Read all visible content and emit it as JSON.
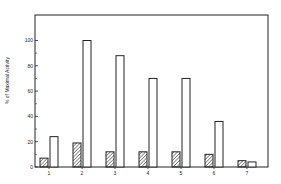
{
  "chart_data": {
    "type": "bar",
    "title": "",
    "xlabel": "",
    "ylabel": "% of Maximal Activity",
    "categories": [
      "1",
      "2",
      "3",
      "4",
      "5",
      "6",
      "7"
    ],
    "series": [
      {
        "name": "hatched",
        "pattern": "diagonal-hatch",
        "values": [
          7,
          19,
          12,
          12,
          12,
          10,
          5
        ]
      },
      {
        "name": "open",
        "pattern": "none",
        "values": [
          24,
          100,
          88,
          70,
          70,
          36,
          4
        ]
      }
    ],
    "yticks": [
      0,
      20,
      40,
      60,
      80,
      100
    ],
    "ylim": [
      0,
      120
    ],
    "grid": false,
    "legend": "none"
  },
  "colors": {
    "stroke": "#222222",
    "background": "#ffffff"
  }
}
